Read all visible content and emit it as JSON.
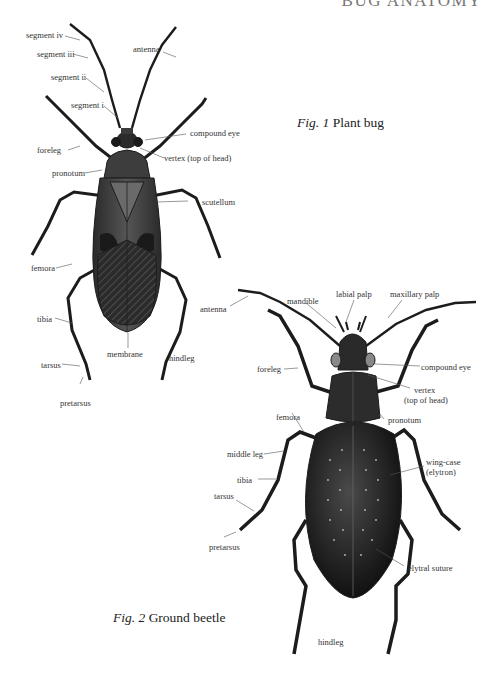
{
  "header": {
    "title": "BUG ANATOMY"
  },
  "figure1": {
    "caption_prefix": "Fig. 1",
    "caption_title": "Plant bug",
    "labels": {
      "segment_iv": "segment iv",
      "segment_iii": "segment iii",
      "segment_ii": "segment ii",
      "segment_i": "segment i",
      "antenna": "antenna",
      "foreleg": "foreleg",
      "compound_eye": "compound eye",
      "vertex": "vertex (top of head)",
      "pronotum": "pronotum",
      "scutellum": "scutellum",
      "femora": "femora",
      "tibia": "tibia",
      "tarsus": "tarsus",
      "pretarsus": "pretarsus",
      "membrane": "membrane",
      "hindleg": "hindleg"
    }
  },
  "figure2": {
    "caption_prefix": "Fig. 2",
    "caption_title": "Ground beetle",
    "labels": {
      "antenna": "antenna",
      "mandible": "mandible",
      "labial_palp": "labial palp",
      "maxillary_palp": "maxillary palp",
      "foreleg": "foreleg",
      "compound_eye": "compound eye",
      "vertex_line1": "vertex",
      "vertex_line2": "(top of head)",
      "femora": "femora",
      "pronotum": "pronotum",
      "middle_leg": "middle leg",
      "wing_case_line1": "wing-case",
      "wing_case_line2": "(elytron)",
      "tibia": "tibia",
      "tarsus": "tarsus",
      "pretarsus": "pretarsus",
      "elytral_suture": "elytral suture",
      "hindleg": "hindleg"
    }
  },
  "colors": {
    "ink": "#1c1c1c",
    "label": "#333333",
    "leader": "#555555"
  }
}
